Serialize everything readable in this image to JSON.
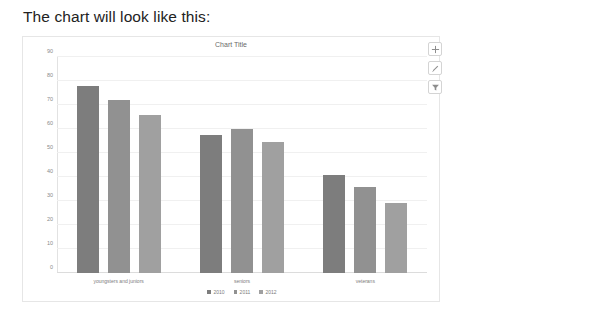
{
  "heading": "The chart will look like this:",
  "toolbar": {
    "buttons": [
      {
        "name": "add-icon",
        "label": "+"
      },
      {
        "name": "edit-pencil-icon",
        "label": "Edit"
      },
      {
        "name": "filter-funnel-icon",
        "label": "Filter"
      }
    ]
  },
  "chart_data": {
    "type": "bar",
    "title": "Chart Title",
    "xlabel": "",
    "ylabel": "",
    "ylim": [
      0,
      90
    ],
    "yticks": [
      0,
      10,
      20,
      30,
      40,
      50,
      60,
      70,
      80,
      90
    ],
    "grid": true,
    "legend_position": "bottom",
    "categories": [
      "youngsters and juniors",
      "seniors",
      "veterans"
    ],
    "series": [
      {
        "name": "2010",
        "color": "#7d7d7d",
        "values": [
          78,
          57.5,
          41
        ]
      },
      {
        "name": "2011",
        "color": "#919191",
        "values": [
          72,
          60,
          36
        ]
      },
      {
        "name": "2012",
        "color": "#a0a0a0",
        "values": [
          66,
          54.5,
          29
        ]
      }
    ]
  }
}
